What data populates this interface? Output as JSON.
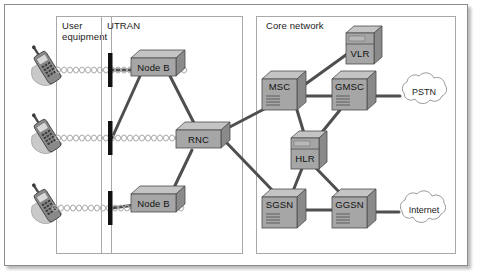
{
  "diagram": {
    "panels": [
      {
        "id": "user-equipment",
        "label": "User\nequipment",
        "x": 56,
        "y": 16,
        "w": 56,
        "h": 238
      },
      {
        "id": "utran",
        "label": "UTRAN",
        "x": 101,
        "y": 16,
        "w": 142,
        "h": 238
      },
      {
        "id": "core-network",
        "label": "Core network",
        "x": 256,
        "y": 16,
        "w": 200,
        "h": 238
      }
    ],
    "nodes": [
      {
        "id": "node-b-top",
        "label": "Node B",
        "type": "flat-box",
        "x": 131,
        "y": 52,
        "w": 45,
        "h": 20
      },
      {
        "id": "node-b-bottom",
        "label": "Node B",
        "type": "flat-box",
        "x": 131,
        "y": 188,
        "w": 45,
        "h": 20
      },
      {
        "id": "rnc",
        "label": "RNC",
        "type": "flat-box",
        "x": 176,
        "y": 124,
        "w": 45,
        "h": 20
      },
      {
        "id": "msc",
        "label": "MSC",
        "type": "vent-box",
        "x": 262,
        "y": 72,
        "w": 44,
        "h": 35
      },
      {
        "id": "gmsc",
        "label": "GMSC",
        "type": "vent-box",
        "x": 332,
        "y": 72,
        "w": 44,
        "h": 35
      },
      {
        "id": "vlr",
        "label": "VLR",
        "type": "tower-box",
        "x": 346,
        "y": 26,
        "w": 28,
        "h": 38
      },
      {
        "id": "hlr",
        "label": "HLR",
        "type": "tower-box",
        "x": 291,
        "y": 131,
        "w": 28,
        "h": 38
      },
      {
        "id": "sgsn",
        "label": "SGSN",
        "type": "vent-box",
        "x": 262,
        "y": 190,
        "w": 44,
        "h": 35
      },
      {
        "id": "ggsn",
        "label": "GGSN",
        "type": "vent-box",
        "x": 332,
        "y": 190,
        "w": 44,
        "h": 35
      }
    ],
    "clouds": [
      {
        "id": "pstn",
        "label": "PSTN",
        "cx": 424,
        "cy": 92,
        "rx": 26,
        "ry": 14
      },
      {
        "id": "internet",
        "label": "Internet",
        "cx": 424,
        "cy": 210,
        "rx": 27,
        "ry": 14
      }
    ],
    "antennas": [
      {
        "id": "antenna-top",
        "x": 110,
        "y": 53,
        "h": 34
      },
      {
        "id": "antenna-middle",
        "x": 110,
        "y": 121,
        "h": 34
      },
      {
        "id": "antenna-bottom",
        "x": 110,
        "y": 191,
        "h": 34
      }
    ],
    "handsets": [
      {
        "id": "handset-top",
        "x": 28,
        "y": 48
      },
      {
        "id": "handset-middle",
        "x": 28,
        "y": 116
      },
      {
        "id": "handset-bottom",
        "x": 28,
        "y": 186
      }
    ],
    "links": [
      {
        "id": "link-antenna-top-nodeb",
        "from": "antenna-top",
        "to": "node-b-top"
      },
      {
        "id": "link-antenna-middle-nodeb",
        "from": "antenna-middle",
        "to": "node-b-top"
      },
      {
        "id": "link-antenna-bottom-nodeb",
        "from": "antenna-bottom",
        "to": "node-b-bottom"
      },
      {
        "id": "link-nodeb-top-rnc",
        "from": "node-b-top",
        "to": "rnc"
      },
      {
        "id": "link-nodeb-bottom-rnc",
        "from": "node-b-bottom",
        "to": "rnc"
      },
      {
        "id": "link-rnc-msc",
        "from": "rnc",
        "to": "msc"
      },
      {
        "id": "link-rnc-sgsn",
        "from": "rnc",
        "to": "sgsn"
      },
      {
        "id": "link-msc-vlr",
        "from": "msc",
        "to": "vlr"
      },
      {
        "id": "link-msc-gmsc",
        "from": "msc",
        "to": "gmsc"
      },
      {
        "id": "link-msc-hlr",
        "from": "msc",
        "to": "hlr"
      },
      {
        "id": "link-gmsc-hlr",
        "from": "gmsc",
        "to": "hlr"
      },
      {
        "id": "link-gmsc-pstn",
        "from": "gmsc",
        "to": "pstn"
      },
      {
        "id": "link-hlr-sgsn",
        "from": "hlr",
        "to": "sgsn"
      },
      {
        "id": "link-hlr-ggsn",
        "from": "hlr",
        "to": "ggsn"
      },
      {
        "id": "link-sgsn-ggsn",
        "from": "sgsn",
        "to": "ggsn"
      },
      {
        "id": "link-ggsn-internet",
        "from": "ggsn",
        "to": "internet"
      }
    ],
    "colors": {
      "box_front": "#a6a6a6",
      "box_top": "#c4c4c4",
      "box_side": "#8a8a8a",
      "box_outline": "#4d4d4d",
      "link": "#4f4f4f",
      "panel_border": "#a8a8a8",
      "frame_border": "#8c8c8c",
      "antenna": "#111111",
      "cloud_fill": "#ffffff",
      "cloud_stroke": "#9a9a9a",
      "wave": "#b0b0b0",
      "background": "#ffffff",
      "text": "#111111"
    }
  }
}
